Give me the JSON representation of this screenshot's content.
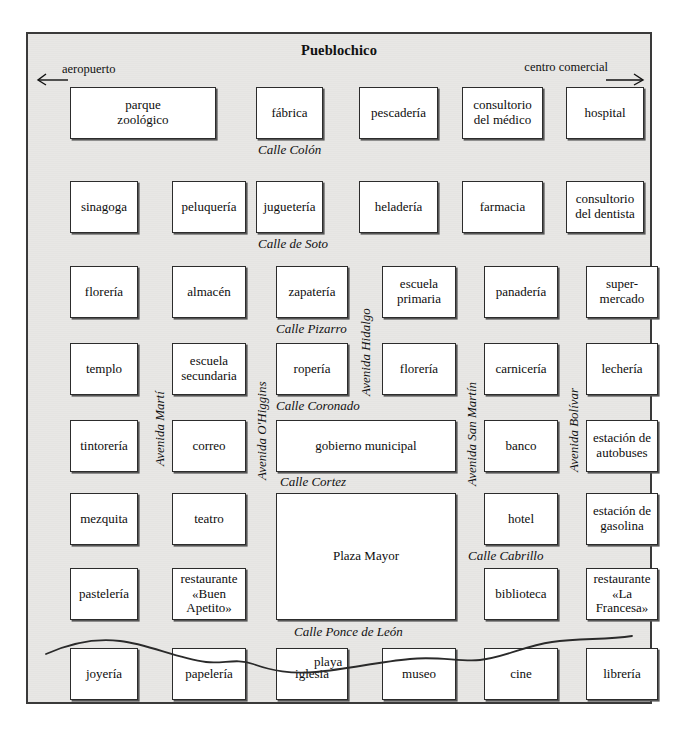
{
  "title": "Pueblochico",
  "edges": {
    "left": {
      "label": "aeropuerto",
      "direction": "left-arrow"
    },
    "right": {
      "label": "centro comercial",
      "direction": "right-arrow"
    }
  },
  "beach": {
    "label": "playa"
  },
  "buildings": [
    {
      "name": "parque zoológico",
      "lines": [
        "parque",
        "zoológico"
      ],
      "x": 42,
      "y": 53,
      "w": 146,
      "h": 52
    },
    {
      "name": "fábrica",
      "lines": [
        "fábrica"
      ],
      "x": 228,
      "y": 53,
      "w": 67,
      "h": 52
    },
    {
      "name": "pescadería",
      "lines": [
        "pescadería"
      ],
      "x": 331,
      "y": 53,
      "w": 79,
      "h": 52
    },
    {
      "name": "consultorio del médico",
      "lines": [
        "consultorio",
        "del médico"
      ],
      "x": 434,
      "y": 53,
      "w": 81,
      "h": 52
    },
    {
      "name": "hospital",
      "lines": [
        "hospital"
      ],
      "x": 538,
      "y": 53,
      "w": 78,
      "h": 52
    },
    {
      "name": "sinagoga",
      "lines": [
        "sinagoga"
      ],
      "x": 42,
      "y": 147,
      "w": 68,
      "h": 52
    },
    {
      "name": "peluquería",
      "lines": [
        "peluquería"
      ],
      "x": 144,
      "y": 147,
      "w": 74,
      "h": 52
    },
    {
      "name": "juguetería",
      "lines": [
        "juguetería"
      ],
      "x": 228,
      "y": 147,
      "w": 67,
      "h": 52
    },
    {
      "name": "heladería",
      "lines": [
        "heladería"
      ],
      "x": 331,
      "y": 147,
      "w": 79,
      "h": 52
    },
    {
      "name": "farmacia",
      "lines": [
        "farmacia"
      ],
      "x": 434,
      "y": 147,
      "w": 81,
      "h": 52
    },
    {
      "name": "consultorio del dentista",
      "lines": [
        "consultorio",
        "del dentista"
      ],
      "x": 538,
      "y": 147,
      "w": 78,
      "h": 52
    },
    {
      "name": "florería",
      "lines": [
        "florería"
      ],
      "x": 42,
      "y": 232,
      "w": 68,
      "h": 52
    },
    {
      "name": "almacén",
      "lines": [
        "almacén"
      ],
      "x": 144,
      "y": 232,
      "w": 74,
      "h": 52
    },
    {
      "name": "zapatería",
      "lines": [
        "zapatería"
      ],
      "x": 248,
      "y": 232,
      "w": 72,
      "h": 52
    },
    {
      "name": "escuela primaria",
      "lines": [
        "escuela",
        "primaria"
      ],
      "x": 354,
      "y": 232,
      "w": 74,
      "h": 52
    },
    {
      "name": "panadería",
      "lines": [
        "panadería"
      ],
      "x": 456,
      "y": 232,
      "w": 74,
      "h": 52
    },
    {
      "name": "super-mercado",
      "lines": [
        "super-",
        "mercado"
      ],
      "x": 558,
      "y": 232,
      "w": 72,
      "h": 52
    },
    {
      "name": "templo",
      "lines": [
        "templo"
      ],
      "x": 42,
      "y": 309,
      "w": 68,
      "h": 52
    },
    {
      "name": "escuela secundaria",
      "lines": [
        "escuela",
        "secundaria"
      ],
      "x": 144,
      "y": 309,
      "w": 74,
      "h": 52
    },
    {
      "name": "ropería",
      "lines": [
        "ropería"
      ],
      "x": 248,
      "y": 309,
      "w": 72,
      "h": 52
    },
    {
      "name": "florería (San Martín)",
      "lines": [
        "florería"
      ],
      "x": 354,
      "y": 309,
      "w": 74,
      "h": 52
    },
    {
      "name": "carnicería",
      "lines": [
        "carnicería"
      ],
      "x": 456,
      "y": 309,
      "w": 74,
      "h": 52
    },
    {
      "name": "lechería",
      "lines": [
        "lechería"
      ],
      "x": 558,
      "y": 309,
      "w": 72,
      "h": 52
    },
    {
      "name": "tintorería",
      "lines": [
        "tintorería"
      ],
      "x": 42,
      "y": 386,
      "w": 68,
      "h": 52
    },
    {
      "name": "correo",
      "lines": [
        "correo"
      ],
      "x": 144,
      "y": 386,
      "w": 74,
      "h": 52
    },
    {
      "name": "gobierno municipal",
      "lines": [
        "gobierno municipal"
      ],
      "x": 248,
      "y": 386,
      "w": 180,
      "h": 52
    },
    {
      "name": "banco",
      "lines": [
        "banco"
      ],
      "x": 456,
      "y": 386,
      "w": 74,
      "h": 52
    },
    {
      "name": "estación de autobuses",
      "lines": [
        "estación de",
        "autobuses"
      ],
      "x": 558,
      "y": 386,
      "w": 72,
      "h": 52
    },
    {
      "name": "mezquita",
      "lines": [
        "mezquita"
      ],
      "x": 42,
      "y": 459,
      "w": 68,
      "h": 52
    },
    {
      "name": "teatro",
      "lines": [
        "teatro"
      ],
      "x": 144,
      "y": 459,
      "w": 74,
      "h": 52
    },
    {
      "name": "Plaza Mayor",
      "lines": [
        "Plaza Mayor"
      ],
      "x": 248,
      "y": 459,
      "w": 180,
      "h": 127
    },
    {
      "name": "hotel",
      "lines": [
        "hotel"
      ],
      "x": 456,
      "y": 459,
      "w": 74,
      "h": 52
    },
    {
      "name": "estación de gasolina",
      "lines": [
        "estación de",
        "gasolina"
      ],
      "x": 558,
      "y": 459,
      "w": 72,
      "h": 52
    },
    {
      "name": "pastelería",
      "lines": [
        "pastelería"
      ],
      "x": 42,
      "y": 534,
      "w": 68,
      "h": 52
    },
    {
      "name": "restaurante «Buen Apetito»",
      "lines": [
        "restaurante",
        "«Buen",
        "Apetito»"
      ],
      "x": 144,
      "y": 534,
      "w": 74,
      "h": 52
    },
    {
      "name": "biblioteca",
      "lines": [
        "biblioteca"
      ],
      "x": 456,
      "y": 534,
      "w": 74,
      "h": 52
    },
    {
      "name": "restaurante «La Francesa»",
      "lines": [
        "restaurante",
        "«La",
        "Francesa»"
      ],
      "x": 558,
      "y": 534,
      "w": 72,
      "h": 52
    },
    {
      "name": "joyería",
      "lines": [
        "joyería"
      ],
      "x": 42,
      "y": 614,
      "w": 68,
      "h": 52
    },
    {
      "name": "papelería",
      "lines": [
        "papelería"
      ],
      "x": 144,
      "y": 614,
      "w": 74,
      "h": 52
    },
    {
      "name": "iglesia",
      "lines": [
        "iglesia"
      ],
      "x": 248,
      "y": 614,
      "w": 72,
      "h": 52
    },
    {
      "name": "museo",
      "lines": [
        "museo"
      ],
      "x": 354,
      "y": 614,
      "w": 74,
      "h": 52
    },
    {
      "name": "cine",
      "lines": [
        "cine"
      ],
      "x": 456,
      "y": 614,
      "w": 74,
      "h": 52
    },
    {
      "name": "librería",
      "lines": [
        "librería"
      ],
      "x": 558,
      "y": 614,
      "w": 72,
      "h": 52
    }
  ],
  "streets_horizontal": [
    {
      "label": "Calle Colón",
      "x": 230,
      "y": 108
    },
    {
      "label": "Calle de Soto",
      "x": 230,
      "y": 202
    },
    {
      "label": "Calle Pizarro",
      "x": 248,
      "y": 287
    },
    {
      "label": "Calle Coronado",
      "x": 248,
      "y": 364
    },
    {
      "label": "Calle Cortez",
      "x": 252,
      "y": 440
    },
    {
      "label": "Calle Cabrillo",
      "x": 440,
      "y": 514
    },
    {
      "label": "Calle Ponce de León",
      "x": 266,
      "y": 590
    }
  ],
  "streets_vertical": [
    {
      "label": "Avenida Martí",
      "x": 124,
      "y": 432
    },
    {
      "label": "Avenida O'Higgins",
      "x": 226,
      "y": 446
    },
    {
      "label": "Avenida Hidalgo",
      "x": 330,
      "y": 362
    },
    {
      "label": "Avenida San Martín",
      "x": 436,
      "y": 452
    },
    {
      "label": "Avenida Bolívar",
      "x": 538,
      "y": 438
    }
  ]
}
